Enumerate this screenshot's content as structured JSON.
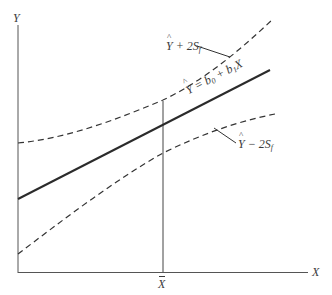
{
  "diagram": {
    "type": "regression-confidence-band",
    "axes": {
      "y_label": "Y",
      "x_label": "X",
      "x_mark_label": "X"
    },
    "lines": {
      "regression": {
        "label_lhs": "Y",
        "label_eq": " = b",
        "label_sub0": "0",
        "label_plus": " + b",
        "label_sub1": "1",
        "label_x": "X",
        "style": "solid"
      },
      "upper_band": {
        "label_y": "Y",
        "label_rest": " + 2S",
        "label_sub": "f",
        "style": "dashed"
      },
      "lower_band": {
        "label_y": "Y",
        "label_rest": " − 2S",
        "label_sub": "f",
        "style": "dashed"
      }
    },
    "colors": {
      "line": "#2b2b2b",
      "axis": "#555555",
      "text": "#3a3a3a",
      "background": "#ffffff"
    }
  }
}
